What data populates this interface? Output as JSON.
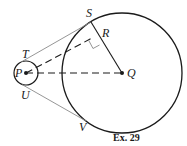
{
  "figure": {
    "caption": "Ex. 29",
    "labels": {
      "S": "S",
      "R": "R",
      "T": "T",
      "P": "P",
      "U": "U",
      "Q": "Q",
      "V": "V"
    },
    "elements": {
      "small_circle": {
        "center": "P",
        "description": "small circle centered at P"
      },
      "large_circle": {
        "center": "Q",
        "description": "large circle centered at Q"
      },
      "tangent_TS": {
        "from": "T",
        "to": "S",
        "style": "solid thin"
      },
      "tangent_UV": {
        "from": "U",
        "to": "V",
        "style": "solid thin"
      },
      "segment_SQ": {
        "from": "S",
        "to": "Q",
        "style": "solid",
        "passes_through": "R"
      },
      "segment_PR": {
        "from": "P",
        "to": "R",
        "style": "dashed"
      },
      "segment_PQ": {
        "from": "P",
        "to": "Q",
        "style": "dashed"
      },
      "right_angle": {
        "at": "R"
      }
    },
    "colors": {
      "stroke": "#1a1a1a",
      "tangent": "#8a8a8a",
      "background": "#ffffff"
    }
  }
}
